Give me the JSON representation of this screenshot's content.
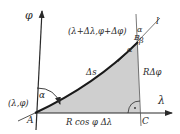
{
  "diagram": {
    "axes": {
      "vertical_label": "φ",
      "horizontal_label": "λ"
    },
    "points": {
      "A": {
        "label": "A",
        "coords": "(λ,φ)"
      },
      "B": {
        "label": "B",
        "coords": "(λ+Δλ,φ+Δφ)"
      },
      "C": {
        "label": "C"
      }
    },
    "line_label": "l",
    "curve_label": "Δs",
    "side_vertical": "RΔφ",
    "side_horizontal": "R cos φ Δλ",
    "angles": {
      "at_A": "α",
      "at_B_lower": "α",
      "at_B_upper": "α",
      "at_B_beta": "β"
    },
    "colors": {
      "shade": "#cfcfcf",
      "stroke": "#2a2a2a"
    }
  }
}
